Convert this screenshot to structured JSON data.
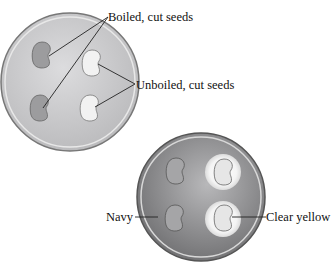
{
  "figure": {
    "top_dish": {
      "labels": {
        "boiled": "Boiled, cut seeds",
        "unboiled": "Unboiled, cut seeds"
      }
    },
    "bottom_dish": {
      "labels": {
        "navy": "Navy",
        "clear": "Clear yellow"
      }
    },
    "colors": {
      "dish_top_fill": "#c9c9cb",
      "dish_bottom_fill": "#8d8d8f",
      "seed_boiled": "#9a9a9c",
      "seed_unboiled": "#f2f2f2",
      "halo": "#f7f7f7"
    }
  }
}
